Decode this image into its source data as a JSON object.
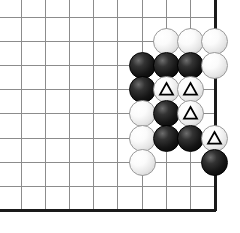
{
  "diagram": {
    "type": "go-board-diagram",
    "board": {
      "width_px": 240,
      "height_px": 233,
      "background_color": "#ffffff",
      "grid_color": "#8c8c8c",
      "grid_line_width": 1,
      "border_color": "#1a1a1a",
      "border_line_width": 3,
      "cell_size": 24.2,
      "origin_x": 21,
      "origin_y": 17,
      "columns": 9,
      "rows": 9,
      "edges": {
        "right_edge_is_board_border": true,
        "bottom_edge_is_board_border": true,
        "top_edge_is_board_border": false,
        "left_edge_is_board_border": false
      },
      "right_border_x": 215,
      "bottom_border_y": 210
    },
    "stone_style": {
      "radius_px": 13.5,
      "black_color": "#000000",
      "white_color": "#f4f4f4",
      "white_outline_color": "#9a9a9a",
      "mark_shape": "triangle",
      "mark_color_on_white": "#000000"
    },
    "legend": {
      "triangle_meaning": "marked white stones"
    },
    "stones": [
      {
        "id": "w1",
        "color": "white",
        "col": 7,
        "row": 2,
        "mark": "none"
      },
      {
        "id": "w2",
        "color": "white",
        "col": 8,
        "row": 2,
        "mark": "none"
      },
      {
        "id": "w3",
        "color": "white",
        "col": 9,
        "row": 2,
        "mark": "none"
      },
      {
        "id": "b1",
        "color": "black",
        "col": 6,
        "row": 3,
        "mark": "none"
      },
      {
        "id": "b2",
        "color": "black",
        "col": 7,
        "row": 3,
        "mark": "none"
      },
      {
        "id": "b3",
        "color": "black",
        "col": 8,
        "row": 3,
        "mark": "none"
      },
      {
        "id": "w4",
        "color": "white",
        "col": 9,
        "row": 3,
        "mark": "none"
      },
      {
        "id": "b4",
        "color": "black",
        "col": 6,
        "row": 4,
        "mark": "none"
      },
      {
        "id": "w5",
        "color": "white",
        "col": 7,
        "row": 4,
        "mark": "triangle"
      },
      {
        "id": "w6",
        "color": "white",
        "col": 8,
        "row": 4,
        "mark": "triangle"
      },
      {
        "id": "w7",
        "color": "white",
        "col": 6,
        "row": 5,
        "mark": "none"
      },
      {
        "id": "b5",
        "color": "black",
        "col": 7,
        "row": 5,
        "mark": "none"
      },
      {
        "id": "w8",
        "color": "white",
        "col": 8,
        "row": 5,
        "mark": "triangle"
      },
      {
        "id": "w9",
        "color": "white",
        "col": 6,
        "row": 6,
        "mark": "none"
      },
      {
        "id": "b6",
        "color": "black",
        "col": 7,
        "row": 6,
        "mark": "none"
      },
      {
        "id": "b7",
        "color": "black",
        "col": 8,
        "row": 6,
        "mark": "none"
      },
      {
        "id": "w10",
        "color": "white",
        "col": 9,
        "row": 6,
        "mark": "triangle"
      },
      {
        "id": "w11",
        "color": "white",
        "col": 6,
        "row": 7,
        "mark": "none"
      },
      {
        "id": "b8",
        "color": "black",
        "col": 9,
        "row": 7,
        "mark": "none"
      }
    ]
  }
}
